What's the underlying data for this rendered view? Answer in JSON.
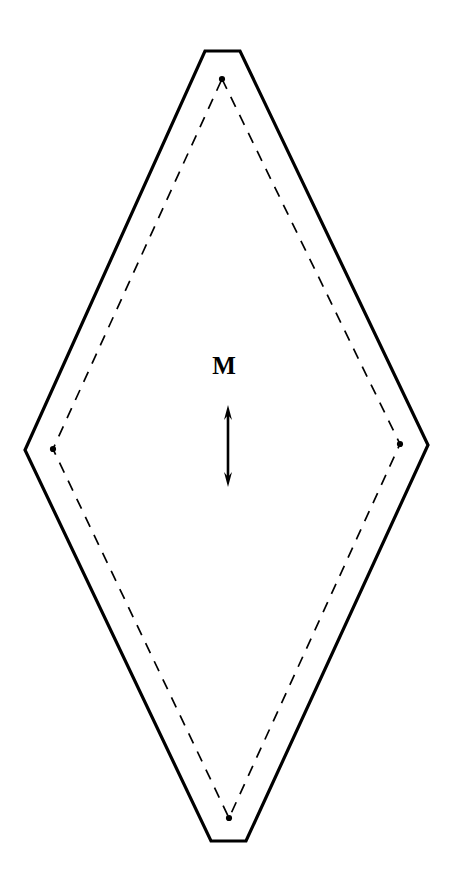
{
  "figure": {
    "name": "magnetization-diamond-diagram",
    "background_color": "#ffffff",
    "stroke_color": "#000000",
    "width": 457,
    "height": 885
  },
  "labels": {
    "magnetization": "M"
  },
  "outer_boundary": {
    "name": "solid-outer-boundary",
    "style": "solid",
    "stroke_width": 3.2,
    "points": "205,51 240,51 428,445 246,841 211,841 25,450"
  },
  "inner_boundary": {
    "name": "dashed-inner-boundary",
    "style": "dashed",
    "stroke_width": 1.7,
    "dash_pattern": "11 9",
    "points": "222,79 400,444 229,818 53,449"
  },
  "vertex_markers": [
    {
      "name": "vertex-dot-top",
      "cx": 222,
      "cy": 79,
      "r": 3.1
    },
    {
      "name": "vertex-dot-right",
      "cx": 400,
      "cy": 444,
      "r": 3.1
    },
    {
      "name": "vertex-dot-bottom",
      "cx": 229,
      "cy": 818,
      "r": 3.1
    },
    {
      "name": "vertex-dot-left",
      "cx": 53,
      "cy": 449,
      "r": 3.1
    }
  ],
  "magnetization_arrow": {
    "name": "magnetization-double-arrow",
    "orientation": "vertical",
    "double_headed": true,
    "x": 228,
    "y_top": 405,
    "y_bottom": 487,
    "shaft_width": 2.6,
    "head_length": 15,
    "head_half_width": 4.0
  },
  "label_position": {
    "m_x": 224,
    "m_y": 374
  }
}
